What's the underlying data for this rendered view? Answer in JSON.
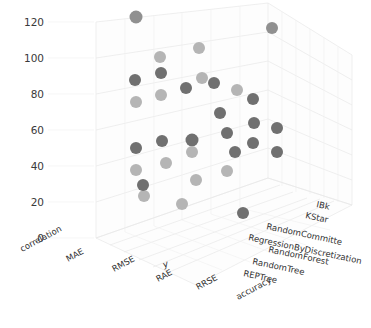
{
  "chart_data": {
    "type": "scatter",
    "projection": "3d",
    "title": "",
    "xlabel": "y",
    "ylabel": "",
    "zlabel": "",
    "grid": true,
    "legend": "none",
    "y_axis": {
      "ticks": [
        0,
        20,
        40,
        60,
        80,
        100,
        120
      ],
      "tick_labels": [
        "0",
        "20",
        "40",
        "60",
        "80",
        "100",
        "120"
      ],
      "ylim": [
        0,
        130
      ]
    },
    "x_axis": {
      "title": "y",
      "categories": [
        "correlation",
        "MAE",
        "RMSE",
        "RAE",
        "RRSE",
        "accuracy"
      ]
    },
    "z_axis": {
      "categories": [
        "IBk",
        "KStar",
        "RandomCommitte",
        "RegressionByDiscretization",
        "RandomForest",
        "RandomTree",
        "REPTree"
      ]
    },
    "marker_colors": {
      "dark": "#707070",
      "light": "#b5b5b5",
      "mid": "#909090"
    },
    "points": [
      {
        "x": "RMSE",
        "z": "IBk",
        "y": 128,
        "shade": "mid",
        "px": 136,
        "py": 17,
        "r": 6.5
      },
      {
        "x": "RAE",
        "z": "IBk",
        "y": 110,
        "shade": "light",
        "px": 160,
        "py": 57,
        "r": 6.0
      },
      {
        "x": "RRSE",
        "z": "IBk",
        "y": 105,
        "shade": "light",
        "px": 199,
        "py": 48,
        "r": 6.0
      },
      {
        "x": "accuracy",
        "z": "IBk",
        "y": 102,
        "shade": "mid",
        "px": 272,
        "py": 28,
        "r": 6.0
      },
      {
        "x": "MAE",
        "z": "KStar",
        "y": 93,
        "shade": "dark",
        "px": 135,
        "py": 80,
        "r": 6.0
      },
      {
        "x": "RMSE",
        "z": "KStar",
        "y": 90,
        "shade": "dark",
        "px": 161,
        "py": 73,
        "r": 6.0
      },
      {
        "x": "RAE",
        "z": "KStar",
        "y": 88,
        "shade": "dark",
        "px": 186,
        "py": 88,
        "r": 6.0
      },
      {
        "x": "RRSE",
        "z": "KStar",
        "y": 86,
        "shade": "dark",
        "px": 214,
        "py": 83,
        "r": 6.0
      },
      {
        "x": "correlation",
        "z": "KStar",
        "y": 84,
        "shade": "light",
        "px": 136,
        "py": 102,
        "r": 6.0
      },
      {
        "x": "MAE",
        "z": "KStar",
        "y": 82,
        "shade": "light",
        "px": 161,
        "py": 95,
        "r": 6.0
      },
      {
        "x": "RMSE",
        "z": "KStar",
        "y": 80,
        "shade": "light",
        "px": 202,
        "py": 78,
        "r": 6.0
      },
      {
        "x": "RAE",
        "z": "KStar",
        "y": 78,
        "shade": "light",
        "px": 237,
        "py": 90,
        "r": 6.0
      },
      {
        "x": "RRSE",
        "z": "RandomCommitte",
        "y": 74,
        "shade": "dark",
        "px": 220,
        "py": 113,
        "r": 6.0
      },
      {
        "x": "accuracy",
        "z": "RandomCommitte",
        "y": 72,
        "shade": "dark",
        "px": 253,
        "py": 99,
        "r": 6.0
      },
      {
        "x": "accuracy",
        "z": "RandomCommitte",
        "y": 68,
        "shade": "dark",
        "px": 254,
        "py": 123,
        "r": 6.0
      },
      {
        "x": "correlation",
        "z": "RegressionByDiscretization",
        "y": 60,
        "shade": "dark",
        "px": 136,
        "py": 148,
        "r": 6.0
      },
      {
        "x": "MAE",
        "z": "RegressionByDiscretization",
        "y": 62,
        "shade": "dark",
        "px": 162,
        "py": 141,
        "r": 6.0
      },
      {
        "x": "RMSE",
        "z": "RegressionByDiscretization",
        "y": 62,
        "shade": "dark",
        "px": 192,
        "py": 140,
        "r": 6.5
      },
      {
        "x": "RAE",
        "z": "RegressionByDiscretization",
        "y": 58,
        "shade": "light",
        "px": 192,
        "py": 152,
        "r": 6.0
      },
      {
        "x": "RRSE",
        "z": "RegressionByDiscretization",
        "y": 64,
        "shade": "dark",
        "px": 227,
        "py": 133,
        "r": 6.0
      },
      {
        "x": "accuracy",
        "z": "RegressionByDiscretization",
        "y": 58,
        "shade": "dark",
        "px": 235,
        "py": 152,
        "r": 6.0
      },
      {
        "x": "correlation",
        "z": "RandomForest",
        "y": 52,
        "shade": "light",
        "px": 136,
        "py": 170,
        "r": 6.0
      },
      {
        "x": "MAE",
        "z": "RandomForest",
        "y": 50,
        "shade": "light",
        "px": 166,
        "py": 163,
        "r": 6.0
      },
      {
        "x": "RMSE",
        "z": "RandomForest",
        "y": 46,
        "shade": "light",
        "px": 196,
        "py": 180,
        "r": 6.0
      },
      {
        "x": "RAE",
        "z": "RandomForest",
        "y": 44,
        "shade": "light",
        "px": 227,
        "py": 171,
        "r": 6.0
      },
      {
        "x": "correlation",
        "z": "RandomTree",
        "y": 38,
        "shade": "light",
        "px": 144,
        "py": 196,
        "r": 6.0
      },
      {
        "x": "MAE",
        "z": "RandomTree",
        "y": 36,
        "shade": "light",
        "px": 182,
        "py": 204,
        "r": 6.0
      },
      {
        "x": "RRSE",
        "z": "REPTree",
        "y": 36,
        "shade": "dark",
        "px": 143,
        "py": 185,
        "r": 6.0
      },
      {
        "x": "accuracy",
        "z": "REPTree",
        "y": 30,
        "shade": "dark",
        "px": 243,
        "py": 213,
        "r": 6.0
      },
      {
        "x": "RAE",
        "z": "RandomForest",
        "y": 40,
        "shade": "dark",
        "px": 253,
        "py": 143,
        "r": 6.0
      },
      {
        "x": "RRSE",
        "z": "RandomCommitte",
        "y": 66,
        "shade": "dark",
        "px": 277,
        "py": 152,
        "r": 6.0
      },
      {
        "x": "accuracy",
        "z": "KStar",
        "y": 76,
        "shade": "dark",
        "px": 277,
        "py": 128,
        "r": 6.0
      }
    ]
  }
}
